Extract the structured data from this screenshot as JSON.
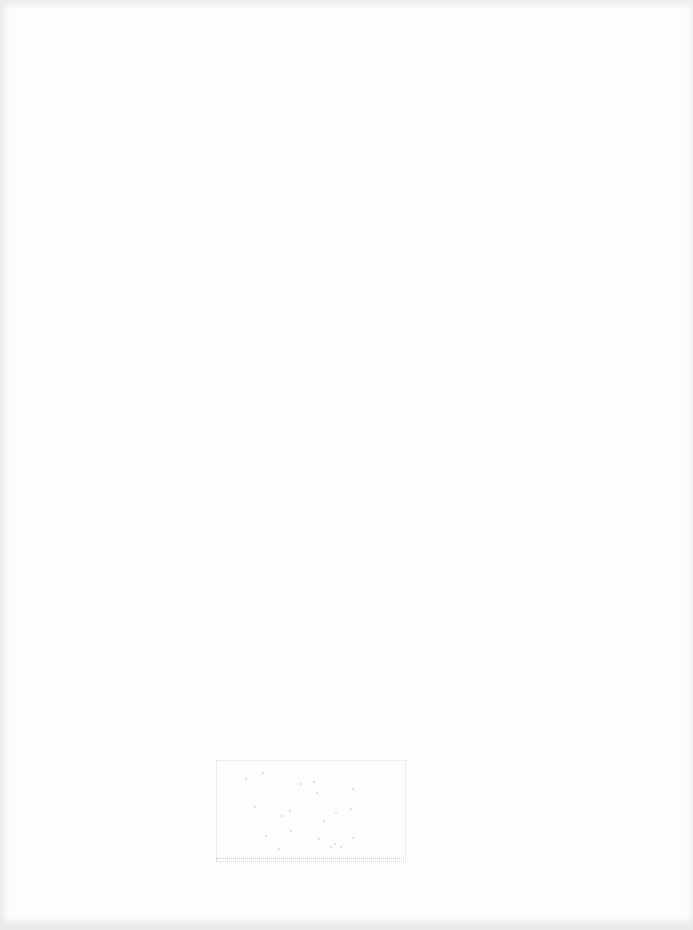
{
  "document": {
    "type": "scanned-page",
    "background_color": "#fdfdfd",
    "content_legible": false
  },
  "stamp": {
    "description": "faded dotted-border box near bottom of page",
    "text": "",
    "border_color": "#dcdcdc",
    "specks": [
      {
        "x": 245,
        "y": 778
      },
      {
        "x": 262,
        "y": 772
      },
      {
        "x": 300,
        "y": 783
      },
      {
        "x": 313,
        "y": 781
      },
      {
        "x": 316,
        "y": 792
      },
      {
        "x": 352,
        "y": 788
      },
      {
        "x": 254,
        "y": 806
      },
      {
        "x": 281,
        "y": 815
      },
      {
        "x": 289,
        "y": 810
      },
      {
        "x": 323,
        "y": 820
      },
      {
        "x": 335,
        "y": 812
      },
      {
        "x": 350,
        "y": 808
      },
      {
        "x": 290,
        "y": 830
      },
      {
        "x": 318,
        "y": 838
      },
      {
        "x": 330,
        "y": 846
      },
      {
        "x": 334,
        "y": 843
      },
      {
        "x": 340,
        "y": 846
      },
      {
        "x": 352,
        "y": 837
      },
      {
        "x": 278,
        "y": 848
      },
      {
        "x": 265,
        "y": 835
      }
    ]
  }
}
